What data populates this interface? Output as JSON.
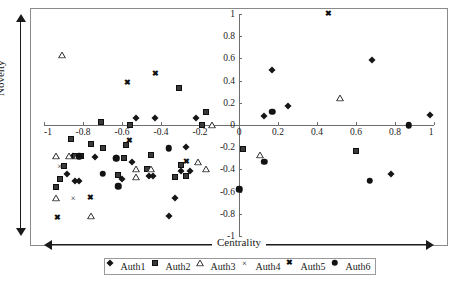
{
  "chart_data": {
    "type": "scatter",
    "title": "",
    "xlabel": "Centrality",
    "ylabel": "Novelty",
    "xlim": [
      -1,
      1
    ],
    "ylim": [
      -1,
      1
    ],
    "grid": false,
    "legend_position": "bottom",
    "xticks": [
      "-1",
      "-0.8",
      "-0.6",
      "-0.4",
      "-0.2",
      "0",
      "0.2",
      "0.4",
      "0.6",
      "0.8",
      "1"
    ],
    "xtick_values": [
      -1,
      -0.8,
      -0.6,
      -0.4,
      -0.2,
      0,
      0.2,
      0.4,
      0.6,
      0.8,
      1
    ],
    "yticks": [
      "-1",
      "-0.8",
      "-0.6",
      "-0.4",
      "-0.2",
      "0",
      "0.2",
      "0.4",
      "0.6",
      "0.8",
      "1"
    ],
    "ytick_values": [
      -1,
      -0.8,
      -0.6,
      -0.4,
      -0.2,
      0,
      0.2,
      0.4,
      0.6,
      0.8,
      1
    ],
    "series": [
      {
        "name": "Auth1",
        "marker": "diamond",
        "color": "#161616",
        "points": [
          [
            -0.53,
            0.06
          ],
          [
            -0.43,
            0.06
          ],
          [
            -0.22,
            0.06
          ],
          [
            -0.27,
            -0.2
          ],
          [
            -0.85,
            -0.28
          ],
          [
            -0.63,
            -0.3
          ],
          [
            -0.74,
            -0.29
          ],
          [
            -0.55,
            -0.33
          ],
          [
            -0.88,
            -0.44
          ],
          [
            -0.84,
            -0.5
          ],
          [
            -0.82,
            -0.5
          ],
          [
            -0.3,
            -0.41
          ],
          [
            -0.25,
            -0.41
          ],
          [
            -0.6,
            -0.49
          ],
          [
            -0.46,
            -0.46
          ],
          [
            -0.44,
            -0.46
          ],
          [
            -0.33,
            -0.66
          ],
          [
            -0.36,
            -0.82
          ],
          [
            0.13,
            0.08
          ],
          [
            0.17,
            0.5
          ],
          [
            0.25,
            0.17
          ],
          [
            0.68,
            0.59
          ],
          [
            0.98,
            0.09
          ],
          [
            0.78,
            -0.44
          ]
        ]
      },
      {
        "name": "Auth2",
        "marker": "square",
        "color": "#3a3a3a",
        "points": [
          [
            -0.71,
            0.03
          ],
          [
            -0.56,
            0.0
          ],
          [
            -0.31,
            0.33
          ],
          [
            -0.19,
            0.0
          ],
          [
            -0.17,
            0.12
          ],
          [
            -0.86,
            -0.13
          ],
          [
            -0.76,
            -0.17
          ],
          [
            -0.58,
            -0.18
          ],
          [
            -0.7,
            -0.21
          ],
          [
            -0.84,
            -0.28
          ],
          [
            -0.81,
            -0.28
          ],
          [
            -0.59,
            -0.3
          ],
          [
            -0.45,
            -0.27
          ],
          [
            -0.9,
            -0.37
          ],
          [
            -0.3,
            -0.36
          ],
          [
            -0.27,
            -0.46
          ],
          [
            -0.92,
            -0.49
          ],
          [
            -0.62,
            -0.45
          ],
          [
            -0.47,
            -0.4
          ],
          [
            -0.94,
            -0.56
          ],
          [
            -0.33,
            -0.47
          ],
          [
            0.02,
            -0.22
          ],
          [
            0.6,
            -0.23
          ]
        ]
      },
      {
        "name": "Auth3",
        "marker": "triangle",
        "color": "#2a2a2a",
        "points": [
          [
            -0.91,
            0.63
          ],
          [
            -0.14,
            0.0
          ],
          [
            -0.94,
            -0.28
          ],
          [
            -0.87,
            -0.28
          ],
          [
            -0.83,
            -0.28
          ],
          [
            -0.21,
            -0.33
          ],
          [
            -0.17,
            -0.4
          ],
          [
            -0.53,
            -0.4
          ],
          [
            -0.53,
            -0.47
          ],
          [
            -0.45,
            -0.4
          ],
          [
            -0.94,
            -0.66
          ],
          [
            -0.76,
            -0.82
          ],
          [
            0.11,
            -0.27
          ],
          [
            0.52,
            0.24
          ]
        ]
      },
      {
        "name": "Auth4",
        "marker": "x",
        "color": "#111111",
        "points": [
          [
            -0.92,
            -0.37
          ],
          [
            -0.85,
            -0.66
          ],
          [
            -0.93,
            -0.83
          ]
        ]
      },
      {
        "name": "Auth5",
        "marker": "x-bold",
        "color": "#111111",
        "points": [
          [
            -0.57,
            0.38
          ],
          [
            -0.43,
            0.46
          ],
          [
            -0.56,
            -0.14
          ],
          [
            -0.27,
            -0.33
          ],
          [
            -0.76,
            -0.66
          ],
          [
            -0.93,
            -0.84
          ],
          [
            0.46,
            1.0
          ]
        ]
      },
      {
        "name": "Auth6",
        "marker": "circle",
        "color": "#121212",
        "points": [
          [
            -0.82,
            -0.28
          ],
          [
            -0.63,
            -0.3
          ],
          [
            -0.36,
            -0.21
          ],
          [
            -0.7,
            -0.44
          ],
          [
            -0.62,
            -0.55
          ],
          [
            0.17,
            0.12
          ],
          [
            0.0,
            -0.58
          ],
          [
            0.13,
            -0.33
          ],
          [
            0.67,
            -0.5
          ],
          [
            0.87,
            0.0
          ]
        ]
      }
    ]
  },
  "axis_arrows": {
    "y_label": "Novelty",
    "x_label": "Centrality"
  },
  "legend": {
    "items": [
      {
        "label": "Auth1",
        "marker": "diamond"
      },
      {
        "label": "Auth2",
        "marker": "square"
      },
      {
        "label": "Auth3",
        "marker": "triangle"
      },
      {
        "label": "Auth4",
        "marker": "x"
      },
      {
        "label": "Auth5",
        "marker": "x-bold"
      },
      {
        "label": "Auth6",
        "marker": "circle"
      }
    ]
  }
}
